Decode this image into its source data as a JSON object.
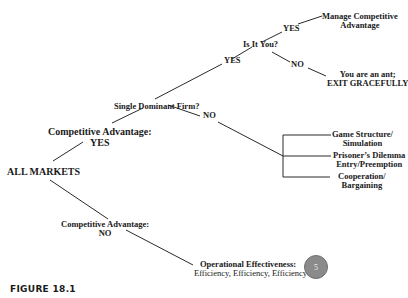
{
  "diagram": {
    "root": "ALL MARKETS",
    "competitive_advantage_yes": {
      "line1": "Competitive Advantage:",
      "line2": "YES"
    },
    "competitive_advantage_no": {
      "line1": "Competitive Advantage:",
      "line2": "NO"
    },
    "single_dominant_firm": "Single Dominant Firm?",
    "sdf_yes": "YES",
    "sdf_no": "NO",
    "is_it_you": "Is It You?",
    "iiy_yes": "YES",
    "iiy_no": "NO",
    "manage": {
      "line1": "Manage Competitive",
      "line2": "Advantage"
    },
    "exit": {
      "line1": "You are an ant;",
      "line2": "EXIT GRACEFULLY"
    },
    "game_structure": {
      "line1": "Game Structure/",
      "line2": "Simulation"
    },
    "prisoners_dilemma": {
      "line1": "Prisoner’s Dilemma",
      "line2": "Entry/Preemption"
    },
    "cooperation": {
      "line1": "Cooperation/",
      "line2": "Bargaining"
    },
    "operational": {
      "line1": "Operational Effectiveness:",
      "line2": "Efficiency, Efficiency, Efficiency"
    },
    "badge": "5",
    "figure_caption": "FIGURE 18.1"
  },
  "colors": {
    "line": "#2a2a2a",
    "text": "#1a1a1a",
    "badge": "#8a8a8a"
  }
}
